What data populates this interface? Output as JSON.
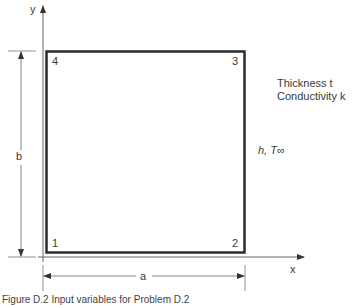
{
  "figure": {
    "axes": {
      "x_label": "x",
      "y_label": "y"
    },
    "corners": {
      "c1": "1",
      "c2": "2",
      "c3": "3",
      "c4": "4"
    },
    "dimensions": {
      "width": "a",
      "height": "b"
    },
    "properties": {
      "thickness": "Thickness t",
      "conductivity": "Conductivity k"
    },
    "boundary": {
      "h": "h,",
      "t_inf": "T∞"
    },
    "caption": "Figure D.2 Input variables for Problem D.2",
    "colors": {
      "line": "#2b2b2b",
      "thin_line": "#555555"
    }
  }
}
